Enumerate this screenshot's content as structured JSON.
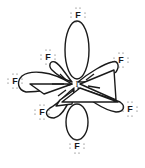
{
  "diagram": {
    "central_atom": {
      "symbol": "I"
    },
    "ligands": [
      {
        "id": "axial-top",
        "symbol": "F"
      },
      {
        "id": "equatorial-upper-left",
        "symbol": "F"
      },
      {
        "id": "equatorial-left",
        "symbol": "F"
      },
      {
        "id": "equatorial-lower-left",
        "symbol": "F"
      },
      {
        "id": "equatorial-upper-right",
        "symbol": "F"
      },
      {
        "id": "equatorial-lower-right",
        "symbol": "F"
      },
      {
        "id": "axial-bottom",
        "symbol": "F"
      }
    ],
    "lone_pairs_per_fluorine": 3,
    "colors": {
      "line": "#1a1a1a",
      "background": "#ffffff"
    }
  }
}
